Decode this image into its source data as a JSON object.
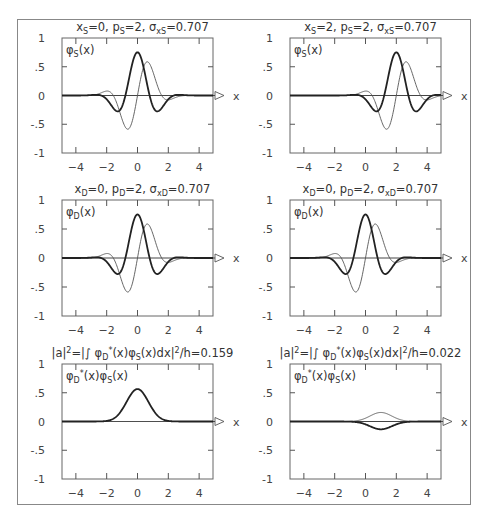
{
  "chart_data": [
    {
      "type": "line",
      "panel": "top-left",
      "title": "x_S=0,  p_S=2,  σ_xS=0.707",
      "title_parts": {
        "x0": 0,
        "p0": 2,
        "sigma": 0.707,
        "subscript": "S"
      },
      "inner_label": "φ_S(x)",
      "xlabel": "x",
      "ylabel": "",
      "xticks": [
        -4,
        -2,
        0,
        2,
        4
      ],
      "yticks": [
        1,
        0.5,
        0,
        -0.5,
        -1
      ],
      "ytick_labels": [
        "1",
        ".5",
        "0",
        "-.5",
        "-1"
      ],
      "xlim": [
        -4.9,
        4.9
      ],
      "ylim": [
        -1,
        1
      ],
      "grid": false,
      "series": [
        {
          "name": "Re φ_S(x)",
          "style": "thick",
          "kind": "wavepacket",
          "part": "re",
          "x0": 0,
          "p0": 2,
          "sigma": 0.707
        },
        {
          "name": "Im φ_S(x)",
          "style": "thin",
          "kind": "wavepacket",
          "part": "im",
          "x0": 0,
          "p0": 2,
          "sigma": 0.707
        }
      ]
    },
    {
      "type": "line",
      "panel": "top-right",
      "title": "x_S=2,  p_S=2,  σ_xS=0.707",
      "title_parts": {
        "x0": 2,
        "p0": 2,
        "sigma": 0.707,
        "subscript": "S"
      },
      "inner_label": "φ_S(x)",
      "xlabel": "x",
      "ylabel": "",
      "xticks": [
        -4,
        -2,
        0,
        2,
        4
      ],
      "yticks": [
        1,
        0.5,
        0,
        -0.5,
        -1
      ],
      "ytick_labels": [
        "1",
        ".5",
        "0",
        "-.5",
        "-1"
      ],
      "xlim": [
        -4.9,
        4.9
      ],
      "ylim": [
        -1,
        1
      ],
      "grid": false,
      "series": [
        {
          "name": "Re φ_S(x)",
          "style": "thick",
          "kind": "wavepacket",
          "part": "re",
          "x0": 2,
          "p0": 2,
          "sigma": 0.707
        },
        {
          "name": "Im φ_S(x)",
          "style": "thin",
          "kind": "wavepacket",
          "part": "im",
          "x0": 2,
          "p0": 2,
          "sigma": 0.707
        }
      ]
    },
    {
      "type": "line",
      "panel": "middle-left",
      "title": "x_D=0,  p_D=2,  σ_xD=0.707",
      "title_parts": {
        "x0": 0,
        "p0": 2,
        "sigma": 0.707,
        "subscript": "D"
      },
      "inner_label": "φ_D(x)",
      "xlabel": "x",
      "ylabel": "",
      "xticks": [
        -4,
        -2,
        0,
        2,
        4
      ],
      "yticks": [
        1,
        0.5,
        0,
        -0.5,
        -1
      ],
      "ytick_labels": [
        "1",
        ".5",
        "0",
        "-.5",
        "-1"
      ],
      "xlim": [
        -4.9,
        4.9
      ],
      "ylim": [
        -1,
        1
      ],
      "grid": false,
      "series": [
        {
          "name": "Re φ_D(x)",
          "style": "thick",
          "kind": "wavepacket",
          "part": "re",
          "x0": 0,
          "p0": 2,
          "sigma": 0.707
        },
        {
          "name": "Im φ_D(x)",
          "style": "thin",
          "kind": "wavepacket",
          "part": "im",
          "x0": 0,
          "p0": 2,
          "sigma": 0.707
        }
      ]
    },
    {
      "type": "line",
      "panel": "middle-right",
      "title": "x_D=0,  p_D=2,  σ_xD=0.707",
      "title_parts": {
        "x0": 0,
        "p0": 2,
        "sigma": 0.707,
        "subscript": "D"
      },
      "inner_label": "φ_D(x)",
      "xlabel": "x",
      "ylabel": "",
      "xticks": [
        -4,
        -2,
        0,
        2,
        4
      ],
      "yticks": [
        1,
        0.5,
        0,
        -0.5,
        -1
      ],
      "ytick_labels": [
        "1",
        ".5",
        "0",
        "-.5",
        "-1"
      ],
      "xlim": [
        -4.9,
        4.9
      ],
      "ylim": [
        -1,
        1
      ],
      "grid": false,
      "series": [
        {
          "name": "Re φ_D(x)",
          "style": "thick",
          "kind": "wavepacket",
          "part": "re",
          "x0": 0,
          "p0": 2,
          "sigma": 0.707
        },
        {
          "name": "Im φ_D(x)",
          "style": "thin",
          "kind": "wavepacket",
          "part": "im",
          "x0": 0,
          "p0": 2,
          "sigma": 0.707
        }
      ]
    },
    {
      "type": "line",
      "panel": "bottom-left",
      "title": "|a|²=|∫ φ_D*(x)φ_S(x)dx|²/h=0.159",
      "transition_probability": 0.159,
      "inner_label": "φ_D*(x)φ_S(x)",
      "xlabel": "x",
      "ylabel": "",
      "xticks": [
        -4,
        -2,
        0,
        2,
        4
      ],
      "yticks": [
        1,
        0.5,
        0,
        -0.5,
        -1
      ],
      "ytick_labels": [
        "1",
        ".5",
        "0",
        "-.5",
        "-1"
      ],
      "xlim": [
        -4.9,
        4.9
      ],
      "ylim": [
        -1,
        1
      ],
      "grid": false,
      "series": [
        {
          "name": "Re φ_D*φ_S",
          "style": "thick",
          "kind": "product",
          "part": "re",
          "D": {
            "x0": 0,
            "p0": 2,
            "sigma": 0.707
          },
          "S": {
            "x0": 0,
            "p0": 2,
            "sigma": 0.707
          }
        },
        {
          "name": "Im φ_D*φ_S",
          "style": "thin",
          "kind": "product",
          "part": "im",
          "D": {
            "x0": 0,
            "p0": 2,
            "sigma": 0.707
          },
          "S": {
            "x0": 0,
            "p0": 2,
            "sigma": 0.707
          }
        }
      ]
    },
    {
      "type": "line",
      "panel": "bottom-right",
      "title": "|a|²=|∫ φ_D*(x)φ_S(x)dx|²/h=0.022",
      "transition_probability": 0.022,
      "inner_label": "φ_D*(x)φ_S(x)",
      "xlabel": "x",
      "ylabel": "",
      "xticks": [
        -4,
        -2,
        0,
        2,
        4
      ],
      "yticks": [
        1,
        0.5,
        0,
        -0.5,
        -1
      ],
      "ytick_labels": [
        "1",
        ".5",
        "0",
        "-.5",
        "-1"
      ],
      "xlim": [
        -4.9,
        4.9
      ],
      "ylim": [
        -1,
        1
      ],
      "grid": false,
      "series": [
        {
          "name": "Re φ_D*φ_S",
          "style": "thick",
          "kind": "product",
          "part": "re",
          "D": {
            "x0": 0,
            "p0": 2,
            "sigma": 0.707
          },
          "S": {
            "x0": 2,
            "p0": 2,
            "sigma": 0.707
          }
        },
        {
          "name": "Im φ_D*φ_S",
          "style": "thin",
          "kind": "product",
          "part": "im",
          "D": {
            "x0": 0,
            "p0": 2,
            "sigma": 0.707
          },
          "S": {
            "x0": 2,
            "p0": 2,
            "sigma": 0.707
          }
        }
      ]
    }
  ]
}
